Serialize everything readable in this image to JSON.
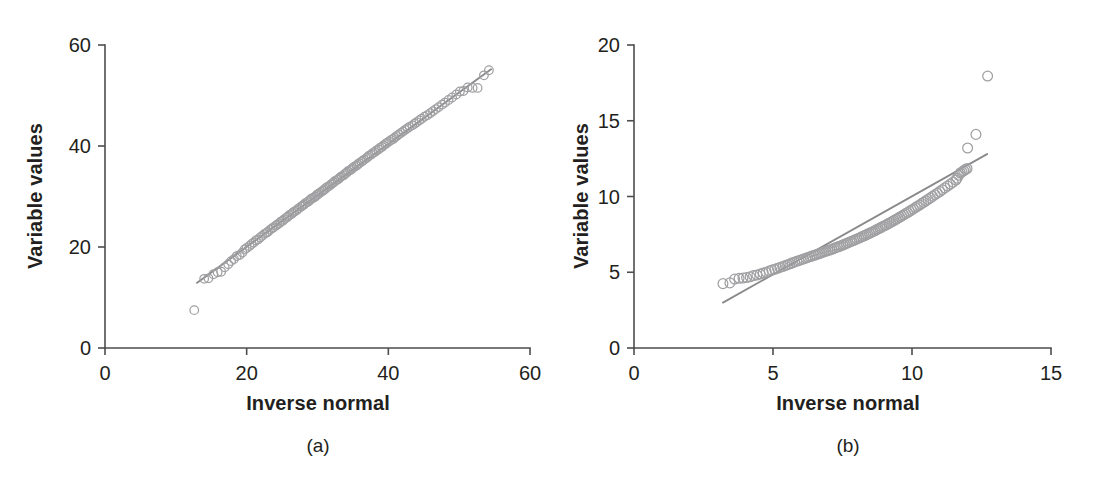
{
  "figure": {
    "background": "#ffffff",
    "marker_color": "#a0a0a3",
    "line_color": "#8a8a8d",
    "axis_color": "#4d4d4f",
    "text_color": "#231f20"
  },
  "panels": [
    {
      "id": "a",
      "caption": "(a)",
      "xlabel": "Inverse normal",
      "ylabel": "Variable values"
    },
    {
      "id": "b",
      "caption": "(b)",
      "xlabel": "Inverse normal",
      "ylabel": "Variable values"
    }
  ],
  "chart_data": [
    {
      "type": "scatter",
      "panel": "a",
      "title": "",
      "xlabel": "Inverse normal",
      "ylabel": "Variable values",
      "xlim": [
        0,
        60
      ],
      "ylim": [
        0,
        60
      ],
      "xticks": [
        0,
        20,
        40,
        60
      ],
      "yticks": [
        0,
        20,
        40,
        60
      ],
      "xtick_labels": [
        "0",
        "20",
        "40",
        "60"
      ],
      "ytick_labels": [
        "0",
        "20",
        "40",
        "60"
      ],
      "grid": false,
      "legend": "none",
      "marker": "open-circle",
      "reference_line": {
        "label": "reference line",
        "x": [
          13.0,
          54.5
        ],
        "y": [
          12.9,
          55.2
        ]
      },
      "points": [
        [
          12.6,
          7.5
        ],
        [
          14.0,
          13.7
        ],
        [
          14.6,
          13.8
        ],
        [
          15.3,
          14.6
        ],
        [
          15.9,
          15.0
        ],
        [
          16.4,
          15.1
        ],
        [
          16.9,
          16.0
        ],
        [
          17.4,
          16.6
        ],
        [
          17.8,
          17.2
        ],
        [
          18.2,
          17.6
        ],
        [
          18.6,
          18.2
        ],
        [
          19.0,
          18.4
        ],
        [
          19.4,
          18.9
        ],
        [
          19.7,
          19.5
        ],
        [
          20.0,
          19.8
        ],
        [
          20.4,
          20.2
        ],
        [
          20.7,
          20.6
        ],
        [
          21.0,
          20.9
        ],
        [
          21.3,
          21.3
        ],
        [
          21.6,
          21.5
        ],
        [
          21.9,
          21.9
        ],
        [
          22.2,
          22.2
        ],
        [
          22.5,
          22.6
        ],
        [
          22.8,
          22.8
        ],
        [
          23.0,
          23.0
        ],
        [
          23.3,
          23.4
        ],
        [
          23.6,
          23.7
        ],
        [
          23.8,
          23.9
        ],
        [
          24.1,
          24.2
        ],
        [
          24.3,
          24.4
        ],
        [
          24.6,
          24.7
        ],
        [
          24.8,
          25.0
        ],
        [
          25.1,
          25.2
        ],
        [
          25.3,
          25.5
        ],
        [
          25.6,
          25.8
        ],
        [
          25.8,
          26.0
        ],
        [
          26.0,
          26.3
        ],
        [
          26.3,
          26.5
        ],
        [
          26.5,
          26.8
        ],
        [
          26.7,
          27.0
        ],
        [
          27.0,
          27.2
        ],
        [
          27.2,
          27.5
        ],
        [
          27.4,
          27.7
        ],
        [
          27.7,
          28.0
        ],
        [
          27.9,
          28.2
        ],
        [
          28.1,
          28.4
        ],
        [
          28.3,
          28.7
        ],
        [
          28.6,
          28.9
        ],
        [
          28.8,
          29.1
        ],
        [
          29.0,
          29.4
        ],
        [
          29.2,
          29.6
        ],
        [
          29.5,
          29.8
        ],
        [
          29.7,
          30.0
        ],
        [
          29.9,
          30.3
        ],
        [
          30.1,
          30.5
        ],
        [
          30.3,
          30.7
        ],
        [
          30.6,
          31.0
        ],
        [
          30.8,
          31.2
        ],
        [
          31.0,
          31.4
        ],
        [
          31.2,
          31.7
        ],
        [
          31.4,
          31.9
        ],
        [
          31.7,
          32.1
        ],
        [
          31.9,
          32.4
        ],
        [
          32.1,
          32.6
        ],
        [
          32.3,
          32.8
        ],
        [
          32.5,
          33.1
        ],
        [
          32.8,
          33.3
        ],
        [
          33.0,
          33.5
        ],
        [
          33.2,
          33.8
        ],
        [
          33.4,
          34.0
        ],
        [
          33.7,
          34.2
        ],
        [
          33.9,
          34.5
        ],
        [
          34.1,
          34.7
        ],
        [
          34.3,
          35.0
        ],
        [
          34.6,
          35.2
        ],
        [
          34.8,
          35.4
        ],
        [
          35.0,
          35.7
        ],
        [
          35.2,
          35.9
        ],
        [
          35.5,
          36.1
        ],
        [
          35.7,
          36.4
        ],
        [
          35.9,
          36.6
        ],
        [
          36.2,
          36.9
        ],
        [
          36.4,
          37.1
        ],
        [
          36.6,
          37.3
        ],
        [
          36.9,
          37.6
        ],
        [
          37.1,
          37.8
        ],
        [
          37.3,
          38.1
        ],
        [
          37.6,
          38.3
        ],
        [
          37.8,
          38.6
        ],
        [
          38.1,
          38.8
        ],
        [
          38.3,
          39.1
        ],
        [
          38.6,
          39.3
        ],
        [
          38.8,
          39.6
        ],
        [
          39.1,
          39.8
        ],
        [
          39.3,
          40.1
        ],
        [
          39.6,
          40.4
        ],
        [
          39.8,
          40.6
        ],
        [
          40.1,
          40.9
        ],
        [
          40.4,
          41.2
        ],
        [
          40.7,
          41.4
        ],
        [
          40.9,
          41.7
        ],
        [
          41.2,
          42.0
        ],
        [
          41.5,
          42.3
        ],
        [
          41.8,
          42.6
        ],
        [
          42.1,
          42.9
        ],
        [
          42.4,
          43.2
        ],
        [
          42.7,
          43.5
        ],
        [
          43.0,
          43.8
        ],
        [
          43.4,
          44.1
        ],
        [
          43.7,
          44.4
        ],
        [
          44.0,
          44.7
        ],
        [
          44.4,
          45.1
        ],
        [
          44.7,
          45.4
        ],
        [
          45.1,
          45.8
        ],
        [
          45.5,
          46.1
        ],
        [
          45.9,
          46.5
        ],
        [
          46.3,
          46.9
        ],
        [
          46.7,
          47.3
        ],
        [
          47.1,
          47.7
        ],
        [
          47.6,
          48.2
        ],
        [
          48.0,
          48.6
        ],
        [
          48.5,
          49.1
        ],
        [
          49.0,
          49.6
        ],
        [
          49.6,
          50.2
        ],
        [
          50.1,
          50.8
        ],
        [
          50.6,
          50.9
        ],
        [
          51.2,
          51.6
        ],
        [
          51.9,
          51.5
        ],
        [
          52.6,
          51.5
        ],
        [
          53.5,
          54.0
        ],
        [
          54.2,
          55.0
        ]
      ]
    },
    {
      "type": "scatter",
      "panel": "b",
      "title": "",
      "xlabel": "Inverse normal",
      "ylabel": "Variable values",
      "xlim": [
        0,
        15
      ],
      "ylim": [
        0,
        20
      ],
      "xticks": [
        0,
        5,
        10,
        15
      ],
      "yticks": [
        0,
        5,
        10,
        15,
        20
      ],
      "xtick_labels": [
        "0",
        "5",
        "10",
        "15"
      ],
      "ytick_labels": [
        "0",
        "5",
        "10",
        "15",
        "20"
      ],
      "grid": false,
      "legend": "none",
      "marker": "open-circle",
      "reference_line": {
        "label": "reference line",
        "x": [
          3.2,
          12.7
        ],
        "y": [
          3.0,
          12.8
        ]
      },
      "points": [
        [
          3.2,
          4.25
        ],
        [
          3.45,
          4.3
        ],
        [
          3.62,
          4.55
        ],
        [
          3.78,
          4.6
        ],
        [
          3.92,
          4.62
        ],
        [
          4.05,
          4.65
        ],
        [
          4.18,
          4.7
        ],
        [
          4.3,
          4.78
        ],
        [
          4.42,
          4.82
        ],
        [
          4.54,
          4.88
        ],
        [
          4.65,
          4.95
        ],
        [
          4.76,
          5.0
        ],
        [
          4.86,
          5.08
        ],
        [
          4.96,
          5.14
        ],
        [
          5.06,
          5.2
        ],
        [
          5.16,
          5.26
        ],
        [
          5.25,
          5.32
        ],
        [
          5.35,
          5.38
        ],
        [
          5.44,
          5.44
        ],
        [
          5.53,
          5.5
        ],
        [
          5.61,
          5.56
        ],
        [
          5.7,
          5.62
        ],
        [
          5.78,
          5.68
        ],
        [
          5.86,
          5.73
        ],
        [
          5.94,
          5.78
        ],
        [
          6.02,
          5.83
        ],
        [
          6.1,
          5.88
        ],
        [
          6.18,
          5.93
        ],
        [
          6.25,
          5.98
        ],
        [
          6.33,
          6.03
        ],
        [
          6.4,
          6.07
        ],
        [
          6.48,
          6.12
        ],
        [
          6.55,
          6.16
        ],
        [
          6.62,
          6.2
        ],
        [
          6.69,
          6.25
        ],
        [
          6.76,
          6.29
        ],
        [
          6.83,
          6.34
        ],
        [
          6.9,
          6.38
        ],
        [
          6.97,
          6.43
        ],
        [
          7.04,
          6.47
        ],
        [
          7.11,
          6.52
        ],
        [
          7.18,
          6.56
        ],
        [
          7.24,
          6.61
        ],
        [
          7.31,
          6.66
        ],
        [
          7.38,
          6.7
        ],
        [
          7.44,
          6.75
        ],
        [
          7.51,
          6.8
        ],
        [
          7.57,
          6.85
        ],
        [
          7.64,
          6.9
        ],
        [
          7.7,
          6.95
        ],
        [
          7.77,
          7.0
        ],
        [
          7.83,
          7.05
        ],
        [
          7.9,
          7.1
        ],
        [
          7.96,
          7.15
        ],
        [
          8.02,
          7.2
        ],
        [
          8.09,
          7.25
        ],
        [
          8.15,
          7.3
        ],
        [
          8.21,
          7.36
        ],
        [
          8.28,
          7.41
        ],
        [
          8.34,
          7.46
        ],
        [
          8.4,
          7.52
        ],
        [
          8.47,
          7.57
        ],
        [
          8.53,
          7.63
        ],
        [
          8.59,
          7.68
        ],
        [
          8.66,
          7.74
        ],
        [
          8.72,
          7.8
        ],
        [
          8.78,
          7.86
        ],
        [
          8.85,
          7.92
        ],
        [
          8.91,
          7.98
        ],
        [
          8.97,
          8.04
        ],
        [
          9.04,
          8.1
        ],
        [
          9.1,
          8.16
        ],
        [
          9.17,
          8.23
        ],
        [
          9.23,
          8.29
        ],
        [
          9.3,
          8.36
        ],
        [
          9.36,
          8.43
        ],
        [
          9.43,
          8.5
        ],
        [
          9.5,
          8.57
        ],
        [
          9.56,
          8.64
        ],
        [
          9.63,
          8.71
        ],
        [
          9.7,
          8.79
        ],
        [
          9.77,
          8.87
        ],
        [
          9.84,
          8.94
        ],
        [
          9.91,
          9.02
        ],
        [
          9.98,
          9.1
        ],
        [
          10.05,
          9.18
        ],
        [
          10.12,
          9.27
        ],
        [
          10.19,
          9.35
        ],
        [
          10.27,
          9.44
        ],
        [
          10.34,
          9.53
        ],
        [
          10.42,
          9.62
        ],
        [
          10.5,
          9.72
        ],
        [
          10.58,
          9.81
        ],
        [
          10.66,
          9.91
        ],
        [
          10.74,
          10.01
        ],
        [
          10.83,
          10.12
        ],
        [
          10.91,
          10.22
        ],
        [
          11.0,
          10.33
        ],
        [
          11.09,
          10.45
        ],
        [
          11.18,
          10.57
        ],
        [
          11.28,
          10.69
        ],
        [
          11.38,
          10.82
        ],
        [
          11.48,
          10.95
        ],
        [
          11.58,
          11.09
        ],
        [
          11.62,
          11.2
        ],
        [
          11.68,
          11.4
        ],
        [
          11.74,
          11.55
        ],
        [
          11.8,
          11.62
        ],
        [
          11.86,
          11.7
        ],
        [
          11.92,
          11.78
        ],
        [
          11.98,
          11.85
        ],
        [
          12.0,
          13.2
        ],
        [
          12.3,
          14.1
        ],
        [
          12.72,
          17.95
        ]
      ]
    }
  ]
}
